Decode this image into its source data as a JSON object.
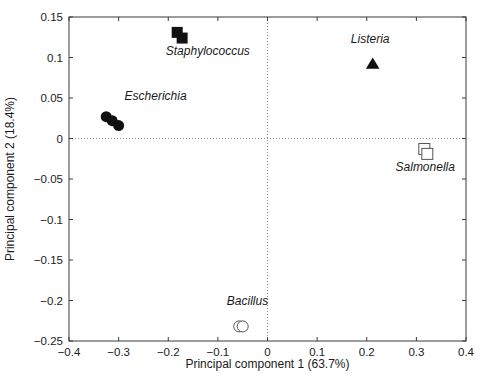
{
  "chart_data": {
    "type": "scatter",
    "title": "",
    "xlabel": "Principal component 1 (63.7%)",
    "ylabel": "Principal component 2 (18.4%)",
    "xlim": [
      -0.4,
      0.4
    ],
    "ylim": [
      -0.25,
      0.15
    ],
    "xticks": [
      "-0.4",
      "-0.3",
      "-0.2",
      "-0.1",
      "0",
      "0.1",
      "0.2",
      "0.3",
      "0.4"
    ],
    "xtick_values": [
      -0.4,
      -0.3,
      -0.2,
      -0.1,
      0,
      0.1,
      0.2,
      0.3,
      0.4
    ],
    "yticks": [
      "0.15",
      "0.1",
      "0.05",
      "0",
      "-0.05",
      "-0.1",
      "-0.15",
      "-0.2",
      "-0.25"
    ],
    "ytick_values": [
      0.15,
      0.1,
      0.05,
      0,
      -0.05,
      -0.1,
      -0.15,
      -0.2,
      -0.25
    ],
    "grid": false,
    "reference_lines": [
      {
        "axis": "horizontal",
        "value": 0,
        "style": "dotted"
      },
      {
        "axis": "vertical",
        "value": 0,
        "style": "dotted"
      }
    ],
    "legend_position": "inline-annotations",
    "series": [
      {
        "name": "Staphylococcus",
        "marker": "filled-square",
        "color": "#111111",
        "label_x": -0.205,
        "label_y": 0.103,
        "points": [
          {
            "x": -0.182,
            "y": 0.131
          },
          {
            "x": -0.172,
            "y": 0.124
          }
        ]
      },
      {
        "name": "Escherichia",
        "marker": "filled-circle",
        "color": "#111111",
        "label_x": -0.288,
        "label_y": 0.047,
        "points": [
          {
            "x": -0.325,
            "y": 0.027
          },
          {
            "x": -0.313,
            "y": 0.022
          },
          {
            "x": -0.3,
            "y": 0.016
          }
        ]
      },
      {
        "name": "Listeria",
        "marker": "filled-triangle",
        "color": "#111111",
        "label_x": 0.168,
        "label_y": 0.118,
        "points": [
          {
            "x": 0.212,
            "y": 0.092
          }
        ]
      },
      {
        "name": "Salmonella",
        "marker": "open-square",
        "color": "#555555",
        "label_x": 0.258,
        "label_y": -0.04,
        "points": [
          {
            "x": 0.316,
            "y": -0.013
          },
          {
            "x": 0.322,
            "y": -0.019
          }
        ]
      },
      {
        "name": "Bacillus",
        "marker": "open-circle",
        "color": "#555555",
        "label_x": -0.082,
        "label_y": -0.205,
        "points": [
          {
            "x": -0.057,
            "y": -0.232
          },
          {
            "x": -0.05,
            "y": -0.232
          }
        ]
      }
    ]
  },
  "caption": {
    "cut_off_line": ""
  }
}
